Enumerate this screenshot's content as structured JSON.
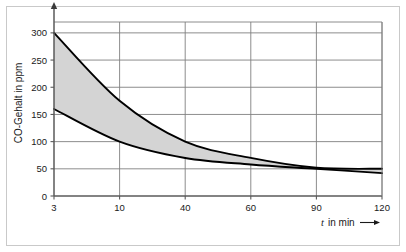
{
  "figure": {
    "frame_color": "#c9c9c9",
    "background": "#ffffff"
  },
  "chart_data": {
    "type": "area",
    "title": "",
    "subtitle": "",
    "xlabel": "t in min",
    "xlabel_arrow": "⟶",
    "ylabel": "CO-Gehalt in ppm",
    "ylabel_arrow": "↑",
    "x_tick_labels": [
      "3",
      "10",
      "40",
      "60",
      "90",
      "120"
    ],
    "x_tick_values": [
      3,
      10,
      40,
      60,
      90,
      120
    ],
    "x_scale": "categorical-even-spacing",
    "y_tick_labels": [
      "0",
      "50",
      "100",
      "150",
      "200",
      "250",
      "300"
    ],
    "y_tick_values": [
      0,
      50,
      100,
      150,
      200,
      250,
      300
    ],
    "ylim": [
      0,
      320
    ],
    "grid": true,
    "grid_axis": "both",
    "grid_color": "#808080",
    "legend": "none",
    "band_fill_color": "#d4d4d4",
    "curve_color": "#000000",
    "series": [
      {
        "name": "Oberer Grenzwert",
        "values": [
          300,
          175,
          100,
          70,
          52,
          50
        ]
      },
      {
        "name": "Unterer Grenzwert",
        "values": [
          160,
          100,
          70,
          58,
          50,
          42
        ]
      }
    ],
    "annotations": []
  }
}
